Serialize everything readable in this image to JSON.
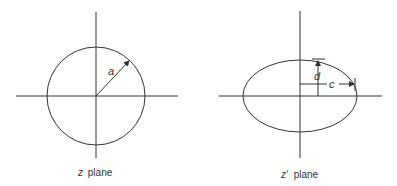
{
  "diagrams": [
    {
      "id": "z-plane",
      "caption": "plane",
      "caption_var": "z",
      "shape": "circle",
      "center": [
        96,
        96
      ],
      "radius": 49,
      "radius_label": "a"
    },
    {
      "id": "z-prime-plane",
      "caption": "plane",
      "caption_var": "z′",
      "shape": "ellipse",
      "center": [
        300,
        96
      ],
      "rx": 57,
      "ry": 36,
      "semi_axis_labels": {
        "vertical": "d",
        "horizontal": "c"
      }
    }
  ],
  "colors": {
    "line": "#333333",
    "background": "#ffffff"
  }
}
